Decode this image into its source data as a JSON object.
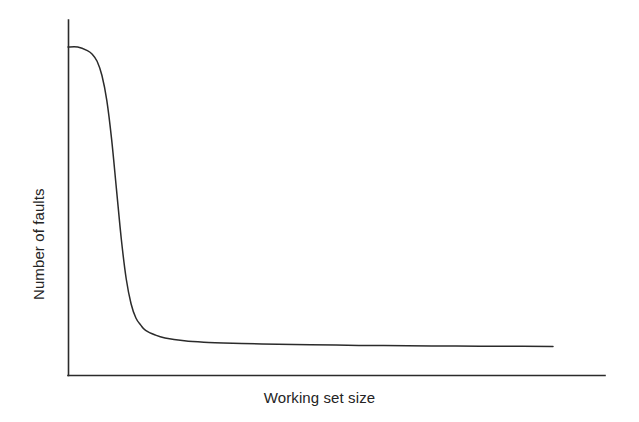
{
  "figure": {
    "background_color": "#ffffff",
    "line_color": "#2b2b2b",
    "text_color": "#242424"
  },
  "axes": {
    "x_title": "Working set size",
    "y_title": "Number of faults"
  },
  "chart_data": {
    "type": "line",
    "title": "",
    "subtitle": "",
    "xlabel": "Working set size",
    "ylabel": "Number of faults",
    "xlim": [
      0,
      100
    ],
    "ylim": [
      0,
      100
    ],
    "grid": false,
    "legend": "none",
    "axis_ticks": {
      "x": [],
      "y": []
    },
    "annotations": [],
    "series": [
      {
        "name": "Number of faults vs working set size",
        "x": [
          0,
          2,
          4,
          5,
          6,
          7,
          8,
          9,
          10,
          11,
          12,
          13,
          14,
          15,
          16,
          18,
          20,
          24,
          28,
          34,
          40,
          50,
          60,
          70,
          80,
          90,
          100
        ],
        "y": [
          92,
          92,
          91,
          90,
          88,
          84,
          77,
          66,
          52,
          38,
          27,
          20,
          16,
          14,
          12.5,
          11.2,
          10.4,
          9.6,
          9.2,
          8.9,
          8.7,
          8.5,
          8.3,
          8.2,
          8.1,
          8.05,
          8.0
        ]
      }
    ]
  }
}
